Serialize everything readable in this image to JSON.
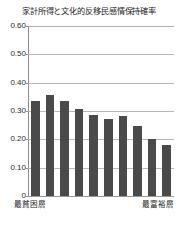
{
  "chart_data": {
    "type": "bar",
    "title": "家計所得と文化的反移民感情保持確率",
    "xlabel": "",
    "ylabel": "",
    "categories": [
      "1",
      "2",
      "3",
      "4",
      "5",
      "6",
      "7",
      "8",
      "9",
      "10"
    ],
    "values": [
      0.335,
      0.358,
      0.335,
      0.308,
      0.287,
      0.273,
      0.281,
      0.248,
      0.2,
      0.179
    ],
    "ylim": [
      0,
      0.6
    ],
    "yticks": [
      0,
      0.1,
      0.2,
      0.3,
      0.4,
      0.5,
      0.6
    ],
    "ytick_labels": [
      "0",
      "0.10",
      "0.20",
      "0.30",
      "0.40",
      "0.50",
      "0.60"
    ],
    "x_axis_end_labels": {
      "left": "最貧困層",
      "right": "最富裕層"
    },
    "grid": true,
    "legend": null,
    "bar_color": "#4a4a4a",
    "grid_color": "#b9b9b9",
    "axis_color": "#8d8d8d"
  }
}
